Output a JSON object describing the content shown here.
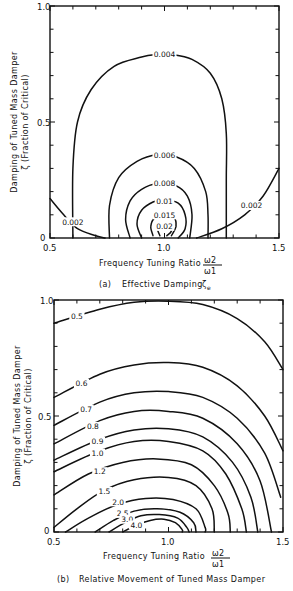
{
  "chart_data": [
    {
      "type": "contour",
      "panel": "(a)",
      "title": "Effective Damping",
      "title_symbol": "ζe",
      "xlabel": "Frequency Tuning Ratio",
      "xlabel_fraction": {
        "num": "ω2",
        "den": "ω1"
      },
      "ylabel_line1": "Damping of Tuned Mass Damper",
      "ylabel_line2": "ζ (Fraction of Critical)",
      "xlim": [
        0.5,
        1.5
      ],
      "ylim": [
        0,
        1.0
      ],
      "xticks": [
        "0.5",
        "1.0",
        "1.5"
      ],
      "yticks": [
        "0",
        "0.5",
        "1.0"
      ],
      "grid": false,
      "contours": [
        {
          "level": "0.004",
          "points": [
            [
              0.6,
              0.0
            ],
            [
              0.6,
              0.3
            ],
            [
              0.62,
              0.5
            ],
            [
              0.68,
              0.64
            ],
            [
              0.78,
              0.74
            ],
            [
              0.9,
              0.78
            ],
            [
              0.96,
              0.79
            ],
            [
              1.04,
              0.79
            ],
            [
              1.12,
              0.77
            ],
            [
              1.2,
              0.71
            ],
            [
              1.25,
              0.6
            ],
            [
              1.27,
              0.45
            ],
            [
              1.27,
              0.25
            ],
            [
              1.27,
              0.0
            ]
          ],
          "label_at": [
            1.0,
            0.79
          ]
        },
        {
          "level": "0.006",
          "points": [
            [
              0.76,
              0.0
            ],
            [
              0.76,
              0.14
            ],
            [
              0.8,
              0.26
            ],
            [
              0.88,
              0.33
            ],
            [
              0.97,
              0.36
            ],
            [
              1.05,
              0.35
            ],
            [
              1.13,
              0.3
            ],
            [
              1.18,
              0.2
            ],
            [
              1.19,
              0.1
            ],
            [
              1.19,
              0.0
            ]
          ],
          "label_at": [
            1.0,
            0.355
          ]
        },
        {
          "level": "0.008",
          "points": [
            [
              0.85,
              0.0
            ],
            [
              0.83,
              0.08
            ],
            [
              0.85,
              0.16
            ],
            [
              0.9,
              0.21
            ],
            [
              0.97,
              0.235
            ],
            [
              1.05,
              0.225
            ],
            [
              1.1,
              0.18
            ],
            [
              1.12,
              0.1
            ],
            [
              1.11,
              0.0
            ]
          ],
          "label_at": [
            1.0,
            0.235
          ]
        },
        {
          "level": "0.01",
          "points": [
            [
              0.9,
              0.0
            ],
            [
              0.88,
              0.06
            ],
            [
              0.9,
              0.12
            ],
            [
              0.95,
              0.155
            ],
            [
              1.0,
              0.165
            ],
            [
              1.06,
              0.15
            ],
            [
              1.09,
              0.1
            ],
            [
              1.09,
              0.04
            ],
            [
              1.06,
              0.0
            ]
          ],
          "label_at": [
            1.0,
            0.16
          ]
        },
        {
          "level": "0.015",
          "points": [
            [
              0.95,
              0.01
            ],
            [
              0.94,
              0.05
            ],
            [
              0.96,
              0.09
            ],
            [
              1.0,
              0.1
            ],
            [
              1.04,
              0.09
            ],
            [
              1.05,
              0.05
            ],
            [
              1.03,
              0.01
            ]
          ],
          "label_at": [
            1.0,
            0.1
          ]
        },
        {
          "level": "0.02",
          "points": [
            [
              0.98,
              0.01
            ],
            [
              0.97,
              0.04
            ],
            [
              0.99,
              0.06
            ],
            [
              1.02,
              0.06
            ],
            [
              1.03,
              0.03
            ],
            [
              1.01,
              0.01
            ]
          ],
          "label_at": [
            1.0,
            0.05
          ]
        },
        {
          "level": "0.002",
          "points": [
            [
              0.5,
              0.17
            ],
            [
              0.56,
              0.1
            ],
            [
              0.62,
              0.04
            ],
            [
              0.7,
              0.01
            ],
            [
              0.74,
              0.0
            ]
          ],
          "label_at": [
            0.6,
            0.07
          ]
        },
        {
          "level": "0.002",
          "points": [
            [
              1.14,
              0.0
            ],
            [
              1.25,
              0.04
            ],
            [
              1.35,
              0.1
            ],
            [
              1.43,
              0.18
            ],
            [
              1.5,
              0.3
            ]
          ],
          "label_at": [
            1.38,
            0.14
          ]
        }
      ]
    },
    {
      "type": "contour",
      "panel": "(b)",
      "title": "Relative Movement of Tuned Mass Damper",
      "xlabel": "Frequency Tuning Ratio",
      "xlabel_fraction": {
        "num": "ω2",
        "den": "ω1"
      },
      "ylabel_line1": "Damping of Tuned Mass Damper",
      "ylabel_line2": "ζ (Fraction of Critical)",
      "xlim": [
        0.5,
        1.5
      ],
      "ylim": [
        0,
        1.0
      ],
      "xticks": [
        "0.5",
        "1.0",
        "1.5"
      ],
      "yticks": [
        "0",
        "0.5",
        "1.0"
      ],
      "grid": false,
      "contours": [
        {
          "level": "0.5",
          "points": [
            [
              0.5,
              0.9
            ],
            [
              0.7,
              0.96
            ],
            [
              0.85,
              0.99
            ],
            [
              1.0,
              0.995
            ],
            [
              1.15,
              0.98
            ],
            [
              1.3,
              0.92
            ],
            [
              1.42,
              0.82
            ],
            [
              1.5,
              0.7
            ]
          ],
          "label_at": [
            0.6,
            0.93
          ]
        },
        {
          "level": "0.6",
          "points": [
            [
              0.5,
              0.58
            ],
            [
              0.7,
              0.68
            ],
            [
              0.85,
              0.72
            ],
            [
              1.0,
              0.73
            ],
            [
              1.15,
              0.71
            ],
            [
              1.3,
              0.63
            ],
            [
              1.42,
              0.5
            ],
            [
              1.5,
              0.35
            ]
          ],
          "label_at": [
            0.62,
            0.64
          ]
        },
        {
          "level": "0.7",
          "points": [
            [
              0.5,
              0.46
            ],
            [
              0.7,
              0.56
            ],
            [
              0.85,
              0.6
            ],
            [
              1.0,
              0.605
            ],
            [
              1.15,
              0.58
            ],
            [
              1.3,
              0.49
            ],
            [
              1.42,
              0.34
            ],
            [
              1.49,
              0.15
            ]
          ],
          "label_at": [
            0.64,
            0.53
          ]
        },
        {
          "level": "0.8",
          "points": [
            [
              0.5,
              0.38
            ],
            [
              0.7,
              0.48
            ],
            [
              0.85,
              0.52
            ],
            [
              1.0,
              0.52
            ],
            [
              1.15,
              0.49
            ],
            [
              1.3,
              0.38
            ],
            [
              1.4,
              0.22
            ],
            [
              1.45,
              0.0
            ]
          ],
          "label_at": [
            0.67,
            0.455
          ]
        },
        {
          "level": "0.9",
          "points": [
            [
              0.5,
              0.31
            ],
            [
              0.7,
              0.4
            ],
            [
              0.85,
              0.44
            ],
            [
              1.0,
              0.445
            ],
            [
              1.15,
              0.41
            ],
            [
              1.28,
              0.3
            ],
            [
              1.36,
              0.15
            ],
            [
              1.39,
              0.0
            ]
          ],
          "label_at": [
            0.69,
            0.39
          ]
        },
        {
          "level": "1.0",
          "points": [
            [
              0.5,
              0.26
            ],
            [
              0.7,
              0.35
            ],
            [
              0.85,
              0.39
            ],
            [
              1.0,
              0.39
            ],
            [
              1.15,
              0.35
            ],
            [
              1.25,
              0.25
            ],
            [
              1.32,
              0.1
            ],
            [
              1.34,
              0.0
            ]
          ],
          "label_at": [
            0.69,
            0.34
          ]
        },
        {
          "level": "1.2",
          "points": [
            [
              0.5,
              0.16
            ],
            [
              0.65,
              0.25
            ],
            [
              0.8,
              0.3
            ],
            [
              0.95,
              0.315
            ],
            [
              1.1,
              0.29
            ],
            [
              1.2,
              0.2
            ],
            [
              1.26,
              0.08
            ],
            [
              1.27,
              0.0
            ]
          ],
          "label_at": [
            0.7,
            0.26
          ]
        },
        {
          "level": "1.5",
          "points": [
            [
              0.5,
              0.02
            ],
            [
              0.6,
              0.1
            ],
            [
              0.72,
              0.18
            ],
            [
              0.85,
              0.225
            ],
            [
              1.0,
              0.235
            ],
            [
              1.12,
              0.2
            ],
            [
              1.19,
              0.1
            ],
            [
              1.2,
              0.0
            ]
          ],
          "label_at": [
            0.72,
            0.175
          ]
        },
        {
          "level": "2.0",
          "points": [
            [
              0.55,
              0.0
            ],
            [
              0.65,
              0.06
            ],
            [
              0.78,
              0.12
            ],
            [
              0.9,
              0.145
            ],
            [
              1.02,
              0.14
            ],
            [
              1.12,
              0.1
            ],
            [
              1.16,
              0.02
            ],
            [
              1.16,
              0.0
            ]
          ],
          "label_at": [
            0.78,
            0.13
          ]
        },
        {
          "level": "2.5",
          "points": [
            [
              0.68,
              0.0
            ],
            [
              0.76,
              0.05
            ],
            [
              0.85,
              0.09
            ],
            [
              0.95,
              0.1
            ],
            [
              1.05,
              0.085
            ],
            [
              1.11,
              0.04
            ],
            [
              1.12,
              0.0
            ]
          ],
          "label_at": [
            0.8,
            0.08
          ]
        },
        {
          "level": "3.0",
          "points": [
            [
              0.74,
              0.0
            ],
            [
              0.81,
              0.04
            ],
            [
              0.88,
              0.07
            ],
            [
              0.96,
              0.075
            ],
            [
              1.04,
              0.06
            ],
            [
              1.08,
              0.02
            ],
            [
              1.09,
              0.0
            ]
          ],
          "label_at": [
            0.82,
            0.055
          ]
        },
        {
          "level": "4.0",
          "points": [
            [
              0.8,
              0.0
            ],
            [
              0.86,
              0.03
            ],
            [
              0.92,
              0.05
            ],
            [
              0.98,
              0.055
            ],
            [
              1.03,
              0.04
            ],
            [
              1.06,
              0.01
            ],
            [
              1.06,
              0.0
            ]
          ],
          "label_at": [
            0.86,
            0.03
          ]
        }
      ]
    }
  ],
  "panels": [
    {
      "caption_prefix": "(a)",
      "caption_text": "Effective Damping",
      "caption_symbol": "ζ",
      "caption_sub": "e"
    },
    {
      "caption_prefix": "(b)",
      "caption_text": "Relative Movement of Tuned Mass Damper"
    }
  ]
}
